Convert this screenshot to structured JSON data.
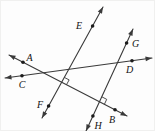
{
  "figure": {
    "width": 155,
    "height": 131,
    "background": "#fdfdfd",
    "line_color": "#3a3a3a",
    "label_color": "#121212",
    "line_width": 1.1,
    "dot_radius": 1.8,
    "arrow_length": 6.5,
    "arrow_half_width": 2.4,
    "label_font_size": 10,
    "lines": [
      {
        "id": "EF",
        "x1": 102,
        "y1": 6,
        "x2": 41,
        "y2": 117,
        "arrow_start": true,
        "arrow_end": true
      },
      {
        "id": "GH",
        "x1": 132,
        "y1": 28,
        "x2": 85,
        "y2": 130,
        "arrow_start": true,
        "arrow_end": true
      },
      {
        "id": "AB",
        "x1": 8,
        "y1": 54,
        "x2": 126,
        "y2": 115,
        "arrow_start": true,
        "arrow_end": true
      },
      {
        "id": "CD",
        "x1": 4,
        "y1": 77,
        "x2": 151,
        "y2": 57,
        "arrow_start": true,
        "arrow_end": true
      }
    ],
    "points": [
      {
        "label": "A",
        "x": 22,
        "y": 61.2,
        "lx": 28.5,
        "ly": 56
      },
      {
        "label": "B",
        "x": 114,
        "y": 108.8,
        "lx": 111,
        "ly": 118.5
      },
      {
        "label": "C",
        "x": 21,
        "y": 74.7,
        "lx": 21,
        "ly": 83
      },
      {
        "label": "D",
        "x": 131,
        "y": 59.7,
        "lx": 128.5,
        "ly": 68.5
      },
      {
        "label": "E",
        "x": 91.6,
        "y": 25,
        "lx": 78,
        "ly": 24
      },
      {
        "label": "F",
        "x": 47.6,
        "y": 105,
        "lx": 39,
        "ly": 103.5
      },
      {
        "label": "G",
        "x": 125.6,
        "y": 42,
        "lx": 134.5,
        "ly": 42.5
      },
      {
        "label": "H",
        "x": 91.9,
        "y": 115,
        "lx": 97,
        "ly": 124
      }
    ],
    "right_angles": [
      {
        "x": 60.6,
        "y": 81.2,
        "u1": [
          0.482,
          -0.877
        ],
        "u2": [
          0.889,
          0.459
        ],
        "size": 5.5
      },
      {
        "x": 98.5,
        "y": 100.8,
        "u1": [
          0.419,
          -0.908
        ],
        "u2": [
          0.889,
          0.459
        ],
        "size": 5.5
      }
    ]
  }
}
